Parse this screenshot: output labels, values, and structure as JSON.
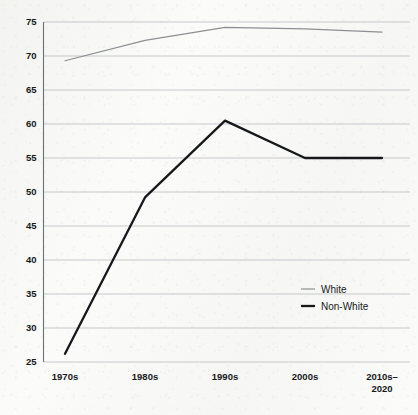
{
  "chart_data": {
    "type": "line",
    "title": "",
    "subtitle": "",
    "xlabel": "",
    "ylabel": "",
    "categories": [
      "1970s",
      "1980s",
      "1990s",
      "2000s",
      "2010s-2020"
    ],
    "category_labels_multiline": [
      [
        "1970s"
      ],
      [
        "1980s"
      ],
      [
        "1990s"
      ],
      [
        "2000s"
      ],
      [
        "2010s–",
        "2020"
      ]
    ],
    "series": [
      {
        "name": "White",
        "values": [
          69.3,
          72.3,
          74.2,
          74.0,
          73.5
        ],
        "color": "#8d8f93",
        "width": 1.2
      },
      {
        "name": "Non-White",
        "values": [
          26.2,
          49.2,
          60.5,
          55.0,
          55.0
        ],
        "color": "#16181b",
        "width": 2.3
      }
    ],
    "ylim": [
      25,
      75
    ],
    "yticks": [
      25,
      30,
      35,
      40,
      45,
      50,
      55,
      60,
      65,
      70,
      75
    ],
    "ytick_labels": [
      "25",
      "30",
      "35",
      "40",
      "45",
      "50",
      "55",
      "60",
      "65",
      "70",
      "75"
    ],
    "grid": true,
    "grid_color": "#b9bcc0",
    "legend_position": "inside-right",
    "legend": [
      {
        "label": "White",
        "color": "#8d8f93",
        "width": 1.2
      },
      {
        "label": "Non-White",
        "color": "#16181b",
        "width": 2.3
      }
    ],
    "background_color": "#fbfbfa",
    "axis_color": "#6d7073"
  }
}
